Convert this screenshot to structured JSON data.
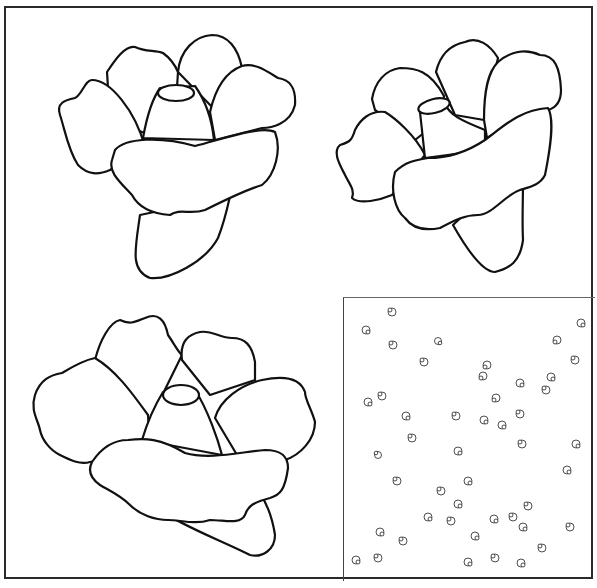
{
  "title": "",
  "figures": [
    {
      "id": "flower-top-left",
      "description": "Line drawing of a flower, side view with cup center"
    },
    {
      "id": "flower-top-right",
      "description": "Line drawing of a flower, side view with cup center"
    },
    {
      "id": "flower-bottom-left",
      "description": "Line drawing of a wide open flower with cup center"
    },
    {
      "id": "pattern-bottom-right",
      "description": "Scattered tiny flower pattern tile"
    }
  ],
  "colors": {
    "line": "#111111",
    "background": "#ffffff",
    "frame": "#2a2a2a"
  },
  "small_flowers": [
    [
      392,
      312
    ],
    [
      365,
      330
    ],
    [
      393,
      345
    ],
    [
      438,
      341
    ],
    [
      424,
      362
    ],
    [
      487,
      365
    ],
    [
      483,
      375
    ],
    [
      581,
      323
    ],
    [
      557,
      340
    ],
    [
      575,
      360
    ],
    [
      551,
      377
    ],
    [
      546,
      390
    ],
    [
      520,
      383
    ],
    [
      496,
      398
    ],
    [
      368,
      402
    ],
    [
      365,
      409
    ],
    [
      406,
      416
    ],
    [
      484,
      418
    ],
    [
      456,
      416
    ],
    [
      449,
      437
    ],
    [
      413,
      438
    ],
    [
      528,
      446
    ],
    [
      574,
      444
    ],
    [
      378,
      455
    ],
    [
      519,
      443
    ],
    [
      458,
      451
    ],
    [
      488,
      471
    ],
    [
      514,
      482
    ],
    [
      458,
      485
    ],
    [
      364,
      490
    ],
    [
      385,
      486
    ],
    [
      447,
      491
    ],
    [
      394,
      519
    ],
    [
      578,
      502
    ],
    [
      566,
      529
    ],
    [
      537,
      520
    ],
    [
      504,
      521
    ],
    [
      466,
      551
    ],
    [
      362,
      531
    ],
    [
      427,
      523
    ],
    [
      417,
      539
    ],
    [
      492,
      544
    ],
    [
      515,
      555
    ],
    [
      567,
      542
    ],
    [
      398,
      548
    ],
    [
      560,
      575
    ],
    [
      355,
      563
    ],
    [
      376,
      562
    ],
    [
      470,
      560
    ],
    [
      498,
      565
    ]
  ]
}
